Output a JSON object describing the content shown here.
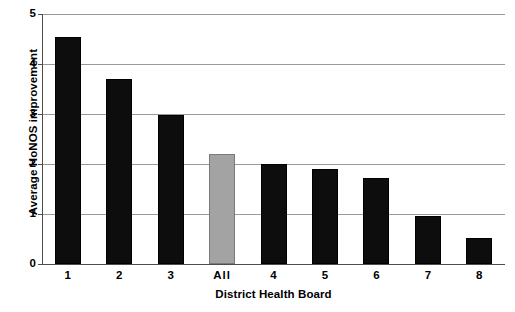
{
  "chart_data": {
    "type": "bar",
    "title": "",
    "xlabel": "District Health Board",
    "ylabel": "Average HoNOS improvement",
    "categories": [
      "1",
      "2",
      "3",
      "All",
      "4",
      "5",
      "6",
      "7",
      "8"
    ],
    "values": [
      4.55,
      3.7,
      2.98,
      2.2,
      2.0,
      1.9,
      1.72,
      0.97,
      0.52
    ],
    "ylim": [
      0,
      5
    ],
    "yticks": [
      0,
      1,
      2,
      3,
      4,
      5
    ],
    "ytick_labels": [
      "0",
      "1",
      "2",
      "3",
      "4",
      "5"
    ],
    "grid": "horizontal",
    "legend": "none",
    "bar_colors": [
      "#0d0d0d",
      "#0d0d0d",
      "#0d0d0d",
      "#a3a3a3",
      "#0d0d0d",
      "#0d0d0d",
      "#0d0d0d",
      "#0d0d0d",
      "#0d0d0d"
    ],
    "highlight_category": "All",
    "highlight_color": "#a3a3a3",
    "series_color": "#0d0d0d",
    "gridline_color": "#9a9a9a",
    "axis_color": "#4d4d4d",
    "background_color": "#ffffff"
  }
}
